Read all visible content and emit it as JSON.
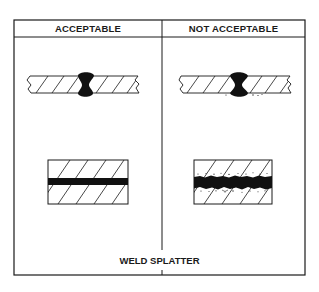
{
  "figure": {
    "columns": [
      {
        "label": "ACCEPTABLE"
      },
      {
        "label": "NOT ACCEPTABLE"
      }
    ],
    "caption": "WELD SPLATTER",
    "panels": [
      {
        "column": "ACCEPTABLE",
        "top_view": "butt-weld-bead",
        "bottom_view": "clean-weld-seam"
      },
      {
        "column": "NOT ACCEPTABLE",
        "top_view": "butt-weld-bead",
        "bottom_view": "weld-seam-with-splatter"
      }
    ],
    "colors": {
      "line": "#1a1a1a",
      "background": "#ffffff"
    }
  }
}
